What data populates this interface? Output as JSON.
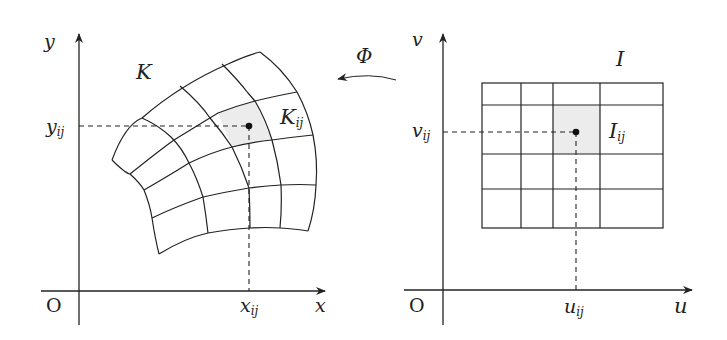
{
  "left_panel": {
    "axis_x": "x",
    "axis_y": "y",
    "origin": "O",
    "region_label": "K",
    "cell_label": {
      "main": "K",
      "sub": "ij"
    },
    "x_tick": {
      "main": "x",
      "sub": "ij"
    },
    "y_tick": {
      "main": "y",
      "sub": "ij"
    }
  },
  "right_panel": {
    "axis_x": "u",
    "axis_y": "v",
    "origin": "O",
    "region_label": "I",
    "cell_label": {
      "main": "I",
      "sub": "ij"
    },
    "x_tick": {
      "main": "u",
      "sub": "ij"
    },
    "y_tick": {
      "main": "v",
      "sub": "ij"
    }
  },
  "mapping": {
    "label": "Φ",
    "direction": "right-to-left"
  },
  "colors": {
    "line": "#222222",
    "highlight": "#ececec"
  }
}
